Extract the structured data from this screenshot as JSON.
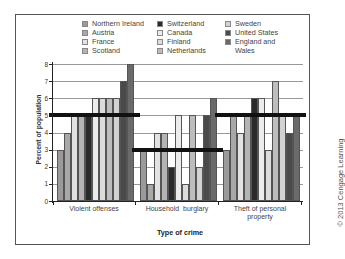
{
  "chart_data": {
    "type": "bar",
    "title": "",
    "xlabel": "Type of crime",
    "ylabel": "Percent of population",
    "ylim": [
      0,
      8
    ],
    "yticks": [
      0,
      1,
      2,
      3,
      4,
      5,
      6,
      7,
      8
    ],
    "grid": true,
    "legend_position": "top",
    "categories": [
      "Violent offenses",
      "Household burglary",
      "Theft of personal property"
    ],
    "category_labels_display": [
      [
        "Violent offenses"
      ],
      [
        "Household  burglary"
      ],
      [
        "Theft of personal",
        "property"
      ]
    ],
    "series": [
      {
        "name": "Northern Ireland",
        "color": "#9a9a9a",
        "values": [
          3,
          3,
          3
        ]
      },
      {
        "name": "Austria",
        "color": "#a8a8a8",
        "values": [
          4,
          1,
          5
        ]
      },
      {
        "name": "France",
        "color": "#e2e2e2",
        "values": [
          5,
          4,
          4
        ]
      },
      {
        "name": "Scotland",
        "color": "#b4b4b4",
        "values": [
          5,
          4,
          5
        ]
      },
      {
        "name": "Switzerland",
        "color": "#2a2a2a",
        "values": [
          5,
          2,
          6
        ]
      },
      {
        "name": "Canada",
        "color": "#ececec",
        "values": [
          6,
          5,
          6
        ]
      },
      {
        "name": "Finland",
        "color": "#dcdcdc",
        "values": [
          6,
          1,
          3
        ]
      },
      {
        "name": "Netherlands",
        "color": "#bdbdbd",
        "values": [
          6,
          5,
          7
        ]
      },
      {
        "name": "Sweden",
        "color": "#d2d2d2",
        "values": [
          6,
          2,
          5
        ]
      },
      {
        "name": "United States",
        "color": "#4a4a4a",
        "values": [
          7,
          5,
          4
        ]
      },
      {
        "name": "England and Wales",
        "color": "#6a6a6a",
        "values": [
          8,
          6,
          5
        ]
      }
    ],
    "averages": [
      5,
      3,
      5
    ],
    "annotations": [
      "Thick horizontal line marks average for each crime type"
    ]
  },
  "legend": {
    "columns": [
      [
        "Northern Ireland",
        "Austria",
        "France",
        "Scotland"
      ],
      [
        "Switzerland",
        "Canada",
        "Finland",
        "Netherlands"
      ],
      [
        "Sweden",
        "United States",
        "England and",
        "Wales"
      ]
    ]
  },
  "copyright": "© 2013 Cengage Learning"
}
